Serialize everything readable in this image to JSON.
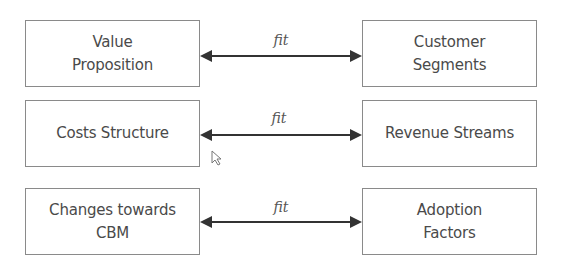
{
  "diagram": {
    "rows": [
      {
        "left": "Value\nProposition",
        "relation": "fit",
        "right": "Customer\nSegments"
      },
      {
        "left": "Costs Structure",
        "relation": "fit",
        "right": "Revenue Streams"
      },
      {
        "left": "Changes towards\nCBM",
        "relation": "fit",
        "right": "Adoption\nFactors"
      }
    ],
    "colors": {
      "border": "#8a8a8a",
      "arrow": "#333333",
      "text": "#4a4a4a"
    }
  }
}
